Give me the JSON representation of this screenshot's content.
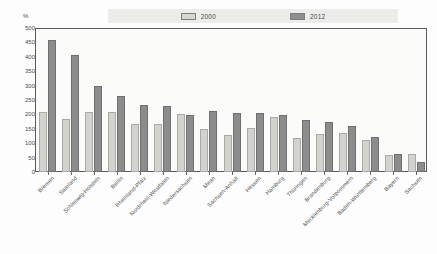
{
  "chart_data": {
    "type": "bar",
    "title": "",
    "xlabel": "",
    "ylabel": "%",
    "ylim": [
      0,
      500
    ],
    "yticks": [
      0,
      50,
      100,
      150,
      200,
      250,
      300,
      350,
      400,
      450,
      500
    ],
    "grid": false,
    "legend_position": "top",
    "categories": [
      "Bremen",
      "Saarland",
      "Schleswig-Holstein",
      "Berlin",
      "Rheinland-Pfalz",
      "Nordrhein-Westfalen",
      "Niedersachsen",
      "Mean",
      "Sachsen-Anhalt",
      "Hessen",
      "Hamburg",
      "Thüringen",
      "Brandenburg",
      "Mecklenburg-Vorpommern",
      "Baden-Württemberg",
      "Bayern",
      "Sachsen"
    ],
    "series": [
      {
        "name": "2000",
        "color": "#d2d2ce",
        "values": [
          210,
          185,
          207,
          208,
          168,
          168,
          200,
          148,
          130,
          152,
          192,
          118,
          133,
          135,
          112,
          60,
          62
        ]
      },
      {
        "name": "2012",
        "color": "#8c8c8c",
        "values": [
          460,
          405,
          297,
          265,
          232,
          230,
          197,
          213,
          205,
          205,
          197,
          180,
          172,
          160,
          122,
          62,
          35
        ]
      }
    ]
  },
  "legend": {
    "entries": [
      {
        "label": "2000",
        "swatch": "light-swatch"
      },
      {
        "label": "2012",
        "swatch": "dark-swatch"
      }
    ]
  },
  "axis": {
    "unit": "%",
    "y_labels": [
      "500",
      "450",
      "400",
      "350",
      "300",
      "250",
      "200",
      "150",
      "100",
      "50",
      "0"
    ]
  }
}
